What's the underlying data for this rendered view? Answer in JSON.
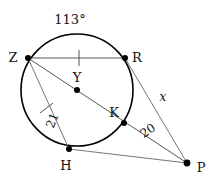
{
  "figure": {
    "type": "circle-geometry-diagram",
    "background_color": "#ffffff",
    "stroke_color": "#000000",
    "line_color": "#555555"
  },
  "circle": {
    "name": "circle-Y",
    "center_label": "Y",
    "cx": 77,
    "cy": 90,
    "r": 56
  },
  "points": [
    {
      "id": "Z",
      "label": "Z",
      "x": 28,
      "y": 58,
      "label_x": 13,
      "label_y": 54,
      "on_circle": true
    },
    {
      "id": "R",
      "label": "R",
      "x": 125,
      "y": 58,
      "label_x": 133,
      "label_y": 54,
      "on_circle": true
    },
    {
      "id": "Y",
      "label": "Y",
      "x": 77,
      "y": 90,
      "label_x": 72,
      "label_y": 78,
      "on_circle": false
    },
    {
      "id": "K",
      "label": "K",
      "x": 124,
      "y": 123,
      "label_x": 112,
      "label_y": 113,
      "on_circle": true
    },
    {
      "id": "H",
      "label": "H",
      "x": 69,
      "y": 149,
      "label_x": 63,
      "label_y": 166,
      "on_circle": true
    },
    {
      "id": "P",
      "label": "P",
      "x": 187,
      "y": 163,
      "label_x": 196,
      "label_y": 170,
      "on_circle": false
    }
  ],
  "segments": [
    {
      "id": "ZR",
      "from": "Z",
      "to": "R",
      "name": "chord-ZR",
      "tick": true
    },
    {
      "id": "ZP",
      "from": "Z",
      "to": "P",
      "name": "secant-ZKP",
      "tick": false
    },
    {
      "id": "ZH",
      "from": "Z",
      "to": "H",
      "name": "chord-ZH",
      "tick": true
    },
    {
      "id": "RP",
      "from": "R",
      "to": "P",
      "name": "segment-RP",
      "tick": false
    },
    {
      "id": "HP",
      "from": "H",
      "to": "P",
      "name": "segment-HP",
      "tick": false
    }
  ],
  "labels": {
    "arc_measure": {
      "text": "113°",
      "x": 68,
      "y": 22,
      "name": "arc-measure-113"
    },
    "length_21": {
      "text": "21",
      "x": 55,
      "y": 120,
      "rotation": -72,
      "name": "length-label-21"
    },
    "length_20": {
      "text": "20",
      "x": 150,
      "y": 133,
      "rotation": -35,
      "name": "length-label-20"
    },
    "unknown_x": {
      "text": "x",
      "x": 162,
      "y": 99,
      "name": "unknown-length-x"
    }
  },
  "ticks": [
    {
      "on": "ZR",
      "x": 79,
      "y": 58,
      "angle": 0,
      "name": "congruence-tick-zr"
    },
    {
      "on": "ZH",
      "x": 46,
      "y": 108,
      "angle": 53,
      "name": "congruence-tick-zh"
    }
  ]
}
